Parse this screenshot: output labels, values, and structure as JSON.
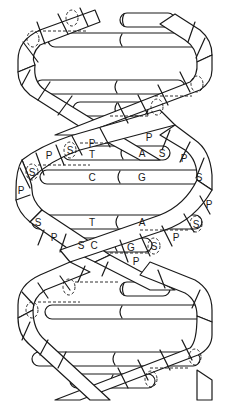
{
  "diagram": {
    "colors": {
      "stroke": "#1a1a1a",
      "background": "#ffffff"
    },
    "labels": [
      {
        "id": "p1",
        "text": "P",
        "x": 92,
        "y": 143
      },
      {
        "id": "s1",
        "text": "S",
        "x": 70,
        "y": 150
      },
      {
        "id": "t1",
        "text": "T",
        "x": 92,
        "y": 153
      },
      {
        "id": "p2",
        "text": "P",
        "x": 49,
        "y": 155
      },
      {
        "id": "p3",
        "text": "P",
        "x": 149,
        "y": 136
      },
      {
        "id": "a1",
        "text": "A",
        "x": 142,
        "y": 153
      },
      {
        "id": "s2",
        "text": "S",
        "x": 162,
        "y": 153
      },
      {
        "id": "p4",
        "text": "P",
        "x": 184,
        "y": 157
      },
      {
        "id": "s3",
        "text": "S",
        "x": 32,
        "y": 172
      },
      {
        "id": "c1",
        "text": "C",
        "x": 92,
        "y": 177
      },
      {
        "id": "g1",
        "text": "G",
        "x": 142,
        "y": 177
      },
      {
        "id": "s4",
        "text": "S",
        "x": 199,
        "y": 177
      },
      {
        "id": "p5",
        "text": "P",
        "x": 21,
        "y": 190
      },
      {
        "id": "p6",
        "text": "P",
        "x": 209,
        "y": 204
      },
      {
        "id": "s5",
        "text": "S",
        "x": 38,
        "y": 222
      },
      {
        "id": "t2",
        "text": "T",
        "x": 92,
        "y": 222
      },
      {
        "id": "a2",
        "text": "A",
        "x": 142,
        "y": 222
      },
      {
        "id": "s6",
        "text": "S",
        "x": 196,
        "y": 224
      },
      {
        "id": "p7",
        "text": "P",
        "x": 54,
        "y": 237
      },
      {
        "id": "p8",
        "text": "P",
        "x": 176,
        "y": 237
      },
      {
        "id": "s7",
        "text": "S",
        "x": 81,
        "y": 245
      },
      {
        "id": "c2",
        "text": "C",
        "x": 94,
        "y": 245
      },
      {
        "id": "g2",
        "text": "G",
        "x": 131,
        "y": 247
      },
      {
        "id": "s8",
        "text": "S",
        "x": 154,
        "y": 246
      },
      {
        "id": "p9",
        "text": "P",
        "x": 136,
        "y": 261
      }
    ]
  }
}
